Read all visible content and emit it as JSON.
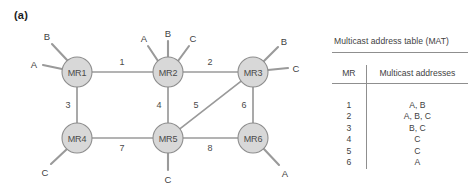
{
  "figure": {
    "panel_label": "(a)"
  },
  "diagram": {
    "nodes": [
      {
        "id": "MR1",
        "label": "MR1",
        "cx": 77,
        "cy": 72
      },
      {
        "id": "MR2",
        "label": "MR2",
        "cx": 168,
        "cy": 72
      },
      {
        "id": "MR3",
        "label": "MR3",
        "cx": 253,
        "cy": 72
      },
      {
        "id": "MR4",
        "label": "MR4",
        "cx": 77,
        "cy": 138
      },
      {
        "id": "MR5",
        "label": "MR5",
        "cx": 168,
        "cy": 138
      },
      {
        "id": "MR6",
        "label": "MR6",
        "cx": 253,
        "cy": 138
      }
    ],
    "links": [
      {
        "label": "1",
        "from": "MR1",
        "to": "MR2",
        "lx": 122,
        "ly": 62
      },
      {
        "label": "2",
        "from": "MR2",
        "to": "MR3",
        "lx": 210,
        "ly": 62
      },
      {
        "label": "3",
        "from": "MR1",
        "to": "MR4",
        "lx": 68,
        "ly": 105
      },
      {
        "label": "4",
        "from": "MR2",
        "to": "MR5",
        "lx": 159,
        "ly": 105
      },
      {
        "label": "5",
        "from": "MR5",
        "to": "MR3",
        "lx": 196,
        "ly": 105
      },
      {
        "label": "6",
        "from": "MR3",
        "to": "MR6",
        "lx": 244,
        "ly": 105
      },
      {
        "label": "7",
        "from": "MR4",
        "to": "MR5",
        "lx": 122,
        "ly": 148
      },
      {
        "label": "8",
        "from": "MR5",
        "to": "MR6",
        "lx": 210,
        "ly": 148
      }
    ],
    "hosts": [
      {
        "node": "MR1",
        "label": "A",
        "x1": 62,
        "y1": 69,
        "x2": 43,
        "y2": 65,
        "tx": 34,
        "ty": 64
      },
      {
        "node": "MR1",
        "label": "B",
        "x1": 67,
        "y1": 60,
        "x2": 52,
        "y2": 44,
        "tx": 47,
        "ty": 36
      },
      {
        "node": "MR2",
        "label": "A",
        "x1": 158,
        "y1": 61,
        "x2": 148,
        "y2": 46,
        "tx": 144,
        "ty": 38
      },
      {
        "node": "MR2",
        "label": "B",
        "x1": 168,
        "y1": 57,
        "x2": 168,
        "y2": 41,
        "tx": 168,
        "ty": 33
      },
      {
        "node": "MR2",
        "label": "C",
        "x1": 178,
        "y1": 61,
        "x2": 189,
        "y2": 46,
        "tx": 193,
        "ty": 38
      },
      {
        "node": "MR3",
        "label": "B",
        "x1": 263,
        "y1": 62,
        "x2": 278,
        "y2": 47,
        "tx": 284,
        "ty": 41
      },
      {
        "node": "MR3",
        "label": "C",
        "x1": 268,
        "y1": 70,
        "x2": 288,
        "y2": 68,
        "tx": 296,
        "ty": 68
      },
      {
        "node": "MR4",
        "label": "C",
        "x1": 67,
        "y1": 149,
        "x2": 51,
        "y2": 164,
        "tx": 45,
        "ty": 172
      },
      {
        "node": "MR5",
        "label": "C",
        "x1": 168,
        "y1": 153,
        "x2": 168,
        "y2": 170,
        "tx": 168,
        "ty": 179
      },
      {
        "node": "MR6",
        "label": "A",
        "x1": 263,
        "y1": 148,
        "x2": 279,
        "y2": 165,
        "tx": 285,
        "ty": 173
      }
    ]
  },
  "mat": {
    "title": "Multicast address table (MAT)",
    "columns": [
      "MR",
      "Multicast addresses"
    ],
    "rows": [
      {
        "mr": "1",
        "addresses": "A, B"
      },
      {
        "mr": "2",
        "addresses": "A, B, C"
      },
      {
        "mr": "3",
        "addresses": "B, C"
      },
      {
        "mr": "4",
        "addresses": "C"
      },
      {
        "mr": "5",
        "addresses": "C"
      },
      {
        "mr": "6",
        "addresses": "A"
      }
    ]
  },
  "colors": {
    "node_fill": "#d8d8d8",
    "node_stroke": "#8d8d8d",
    "link": "#9a9a9a",
    "text": "#3f3f3f",
    "rule": "#8f8f8f"
  }
}
